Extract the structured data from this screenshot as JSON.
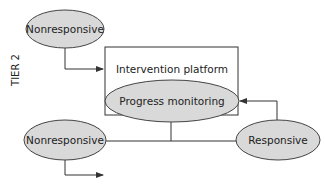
{
  "diagram": {
    "tier_label": "TIER 2",
    "nodes": {
      "nonresponsive_top": "Nonresponsive",
      "intervention_platform": "Intervention platform",
      "progress_monitoring": "Progress monitoring",
      "nonresponsive_bottom": "Nonresponsive",
      "responsive": "Responsive"
    },
    "edges": [
      {
        "from": "nonresponsive_top",
        "to": "intervention_platform",
        "arrow": true
      },
      {
        "from": "progress_monitoring",
        "to": "nonresponsive_bottom",
        "arrow": false
      },
      {
        "from": "progress_monitoring",
        "to": "responsive",
        "arrow": false
      },
      {
        "from": "responsive",
        "to": "progress_monitoring",
        "arrow": true
      },
      {
        "from": "nonresponsive_bottom",
        "to": "next_tier",
        "arrow": true
      }
    ],
    "colors": {
      "ellipse_fill": "#d9d9d9",
      "stroke": "#333333"
    }
  }
}
